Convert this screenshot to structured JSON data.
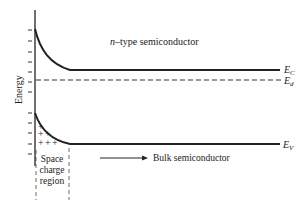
{
  "diagram": {
    "title_prefix": "n",
    "title_suffix": "–type semiconductor",
    "y_axis_label": "Energy",
    "levels": {
      "conduction": {
        "label_main": "E",
        "label_sub": "C"
      },
      "donor": {
        "label_main": "E",
        "label_sub": "d"
      },
      "valence": {
        "label_main": "E",
        "label_sub": "V"
      }
    },
    "space_charge": {
      "line1": "Space",
      "line2": "charge",
      "line3": "region",
      "charges": [
        "+",
        "+",
        "+",
        "+",
        "+",
        "+"
      ]
    },
    "bulk_label": "Bulk semiconductor",
    "colors": {
      "ink": "#222222",
      "background": "#ffffff"
    }
  }
}
